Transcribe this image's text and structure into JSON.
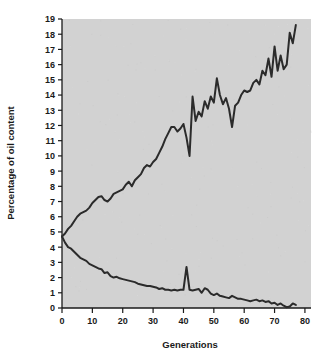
{
  "chart_data": {
    "type": "line",
    "title": "",
    "xlabel": "Generations",
    "ylabel": "Percentage of oil content",
    "xlim": [
      0,
      82
    ],
    "ylim": [
      0,
      19
    ],
    "xticks": [
      0,
      10,
      20,
      30,
      40,
      50,
      60,
      70,
      80
    ],
    "yticks": [
      0,
      1,
      2,
      3,
      4,
      5,
      6,
      7,
      8,
      9,
      10,
      11,
      12,
      13,
      14,
      15,
      16,
      17,
      18,
      19
    ],
    "grid": false,
    "legend": "none",
    "plot_background": "#d2d2d2",
    "line_color": "#2b2b2b",
    "series": [
      {
        "name": "Illinois High Oil",
        "x": [
          0,
          1,
          2,
          3,
          4,
          5,
          6,
          7,
          8,
          9,
          10,
          11,
          12,
          13,
          14,
          15,
          16,
          17,
          18,
          19,
          20,
          21,
          22,
          23,
          24,
          25,
          26,
          27,
          28,
          29,
          30,
          31,
          32,
          33,
          34,
          35,
          36,
          37,
          38,
          39,
          40,
          41,
          42,
          43,
          44,
          45,
          46,
          47,
          48,
          49,
          50,
          51,
          52,
          53,
          54,
          55,
          56,
          57,
          58,
          59,
          60,
          61,
          62,
          63,
          64,
          65,
          66,
          67,
          68,
          69,
          70,
          71,
          72,
          73,
          74,
          75,
          76,
          77
        ],
        "values": [
          4.7,
          4.9,
          5.2,
          5.4,
          5.7,
          6.0,
          6.2,
          6.3,
          6.4,
          6.6,
          6.9,
          7.1,
          7.3,
          7.35,
          7.1,
          7.0,
          7.2,
          7.5,
          7.6,
          7.7,
          7.8,
          8.1,
          8.3,
          8.0,
          8.4,
          8.6,
          8.8,
          9.2,
          9.4,
          9.3,
          9.6,
          9.8,
          10.2,
          10.6,
          11.1,
          11.5,
          11.9,
          11.9,
          11.6,
          11.8,
          12.1,
          11.2,
          10.0,
          13.9,
          12.3,
          12.9,
          12.6,
          13.6,
          13.1,
          13.9,
          13.5,
          15.1,
          14.0,
          13.4,
          13.8,
          13.1,
          11.9,
          13.3,
          13.5,
          14.0,
          14.3,
          14.2,
          14.3,
          14.8,
          15.0,
          14.7,
          15.6,
          15.3,
          16.4,
          15.2,
          17.2,
          15.6,
          16.6,
          15.7,
          16.0,
          18.1,
          17.4,
          18.6
        ]
      },
      {
        "name": "Illinois Low Oil",
        "x": [
          0,
          1,
          2,
          3,
          4,
          5,
          6,
          7,
          8,
          9,
          10,
          11,
          12,
          13,
          14,
          15,
          16,
          17,
          18,
          19,
          20,
          21,
          22,
          23,
          24,
          25,
          26,
          27,
          28,
          29,
          30,
          31,
          32,
          33,
          34,
          35,
          36,
          37,
          38,
          39,
          40,
          41,
          42,
          43,
          44,
          45,
          46,
          47,
          48,
          49,
          50,
          51,
          52,
          53,
          54,
          55,
          56,
          57,
          58,
          59,
          60,
          61,
          62,
          63,
          64,
          65,
          66,
          67,
          68,
          69,
          70,
          71,
          72,
          73,
          74,
          75,
          76,
          77
        ],
        "values": [
          4.7,
          4.3,
          4.0,
          3.9,
          3.7,
          3.5,
          3.3,
          3.2,
          3.1,
          2.9,
          2.8,
          2.7,
          2.6,
          2.55,
          2.3,
          2.35,
          2.1,
          2.0,
          2.05,
          1.95,
          1.9,
          1.85,
          1.8,
          1.75,
          1.7,
          1.6,
          1.55,
          1.5,
          1.45,
          1.45,
          1.4,
          1.35,
          1.25,
          1.3,
          1.2,
          1.2,
          1.15,
          1.2,
          1.15,
          1.2,
          1.2,
          2.7,
          1.2,
          1.15,
          1.2,
          1.25,
          1.0,
          1.3,
          1.2,
          0.95,
          0.85,
          0.95,
          0.8,
          0.75,
          0.7,
          0.65,
          0.8,
          0.7,
          0.6,
          0.6,
          0.55,
          0.5,
          0.45,
          0.5,
          0.55,
          0.45,
          0.5,
          0.4,
          0.45,
          0.3,
          0.35,
          0.2,
          0.3,
          0.15,
          0.05,
          0.1,
          0.3,
          0.2
        ]
      }
    ]
  }
}
